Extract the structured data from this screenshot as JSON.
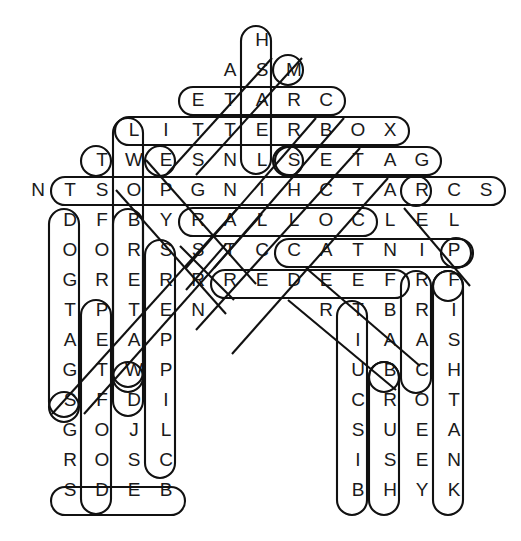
{
  "puzzle": {
    "kind": "word-search",
    "theme": "cat-supplies",
    "grid_cols": 15,
    "grid_rows": 16,
    "cell_width": 32,
    "cell_height": 30,
    "origin_x": 22,
    "origin_y": 25,
    "ink_color": "#111111",
    "letter_color": "#1a1a1a",
    "background_color": "#ffffff",
    "rows": [
      {
        "row": 0,
        "start_col": 7,
        "letters": [
          "H"
        ]
      },
      {
        "row": 1,
        "start_col": 6,
        "letters": [
          "A",
          "S",
          "M"
        ]
      },
      {
        "row": 2,
        "start_col": 5,
        "letters": [
          "E",
          "T",
          "A",
          "R",
          "C"
        ]
      },
      {
        "row": 3,
        "start_col": 3,
        "letters": [
          "L",
          "I",
          "T",
          "T",
          "E",
          "R",
          "B",
          "O",
          "X"
        ]
      },
      {
        "row": 4,
        "start_col": 2,
        "letters": [
          "T",
          "W",
          "E",
          "S",
          "N",
          "L",
          "S",
          "E",
          "T",
          "A",
          "G"
        ]
      },
      {
        "row": 5,
        "start_col": 0,
        "letters": [
          "N",
          "T",
          "S",
          "O",
          "P",
          "G",
          "N",
          "I",
          "H",
          "C",
          "T",
          "A",
          "R",
          "C",
          "S"
        ]
      },
      {
        "row": 6,
        "start_col": 1,
        "letters": [
          "D",
          "F",
          "B",
          "Y",
          "R",
          "A",
          "L",
          "L",
          "O",
          "C",
          "L",
          "E",
          "L"
        ]
      },
      {
        "row": 7,
        "start_col": 1,
        "letters": [
          "O",
          "O",
          "R",
          "S",
          "S",
          "T",
          "C",
          "C",
          "A",
          "T",
          "N",
          "I",
          "P"
        ]
      },
      {
        "row": 8,
        "start_col": 1,
        "letters": [
          "G",
          "R",
          "E",
          "R",
          "R",
          "R",
          "E",
          "D",
          "E",
          "E",
          "F",
          "R",
          "F"
        ]
      },
      {
        "row": 9,
        "start_col": 1,
        "letters": [
          "T",
          "P",
          "T",
          "E",
          "N",
          "",
          "",
          "",
          "R",
          "T",
          "B",
          "R",
          "I"
        ]
      },
      {
        "row": 10,
        "start_col": 1,
        "letters": [
          "A",
          "E",
          "A",
          "P",
          "",
          "",
          "",
          "",
          "",
          "I",
          "A",
          "A",
          "S"
        ]
      },
      {
        "row": 11,
        "start_col": 1,
        "letters": [
          "G",
          "T",
          "W",
          "P",
          "",
          "",
          "",
          "",
          "",
          "U",
          "B",
          "C",
          "H"
        ]
      },
      {
        "row": 12,
        "start_col": 1,
        "letters": [
          "S",
          "F",
          "D",
          "I",
          "",
          "",
          "",
          "",
          "",
          "C",
          "R",
          "O",
          "T"
        ]
      },
      {
        "row": 13,
        "start_col": 1,
        "letters": [
          "G",
          "O",
          "J",
          "L",
          "",
          "",
          "",
          "",
          "",
          "S",
          "U",
          "E",
          "A"
        ]
      },
      {
        "row": 14,
        "start_col": 1,
        "letters": [
          "R",
          "O",
          "S",
          "C",
          "",
          "",
          "",
          "",
          "",
          "I",
          "S",
          "E",
          "N"
        ]
      },
      {
        "row": 15,
        "start_col": 1,
        "letters": [
          "S",
          "D",
          "E",
          "B",
          "",
          "",
          "",
          "",
          "",
          "B",
          "H",
          "Y",
          "K"
        ]
      }
    ],
    "found_words": [
      {
        "word": "CRATE",
        "direction": "horizontal-reversed",
        "row": 2,
        "from_col": 5,
        "to_col": 9
      },
      {
        "word": "LITTERBOX",
        "direction": "horizontal",
        "row": 3,
        "from_col": 3,
        "to_col": 11
      },
      {
        "word": "GATES",
        "direction": "horizontal-reversed",
        "row": 4,
        "from_col": 8,
        "to_col": 12
      },
      {
        "word": "SCRATCHINGPOST",
        "direction": "horizontal-reversed",
        "row": 5,
        "from_col": 1,
        "to_col": 14
      },
      {
        "word": "COLLAR",
        "direction": "horizontal-reversed",
        "row": 6,
        "from_col": 5,
        "to_col": 10
      },
      {
        "word": "CATNIP",
        "direction": "horizontal",
        "row": 7,
        "from_col": 8,
        "to_col": 13
      },
      {
        "word": "FEEDER",
        "direction": "horizontal-reversed",
        "row": 8,
        "from_col": 6,
        "to_col": 11
      },
      {
        "word": "BEDS",
        "direction": "horizontal-reversed",
        "row": 15,
        "from_col": 1,
        "to_col": 4
      },
      {
        "word": "HSAW",
        "direction": "vertical",
        "col": 7,
        "from_row": 0,
        "to_row": 4
      },
      {
        "word": "TOYS",
        "direction": "vertical",
        "col": 3,
        "from_row": 3,
        "to_row": 12
      },
      {
        "word": "DOGTAGS",
        "direction": "vertical",
        "col": 1,
        "from_row": 6,
        "to_row": 12
      },
      {
        "word": "PETSOFD",
        "direction": "vertical",
        "col": 2,
        "from_row": 9,
        "to_row": 15
      },
      {
        "word": "WATER",
        "direction": "vertical",
        "col": 3,
        "from_row": 6,
        "to_row": 11
      },
      {
        "word": "SRREPPILC",
        "direction": "vertical",
        "col": 4,
        "from_row": 7,
        "to_row": 14
      },
      {
        "word": "TIUCSIB",
        "direction": "vertical",
        "col": 10,
        "from_row": 9,
        "to_row": 15
      },
      {
        "word": "BRUSH",
        "direction": "vertical",
        "col": 11,
        "from_row": 11,
        "to_row": 15
      },
      {
        "word": "RRAC",
        "direction": "vertical",
        "col": 12,
        "from_row": 8,
        "to_row": 11
      },
      {
        "word": "FISHTANK",
        "direction": "vertical",
        "col": 13,
        "from_row": 8,
        "to_row": 15
      },
      {
        "word": "MOUSE",
        "direction": "diagonal-up-right",
        "notes": "M at row1"
      },
      {
        "word": "LEASH-diagonal",
        "direction": "diagonal"
      }
    ],
    "circled_letters": [
      "H",
      "M",
      "T",
      "S",
      "L",
      "R",
      "D",
      "P",
      "W",
      "S",
      "F",
      "C",
      "T",
      "B",
      "F",
      "B",
      "H",
      "K",
      "S",
      "D",
      "B",
      "R",
      "C"
    ]
  }
}
